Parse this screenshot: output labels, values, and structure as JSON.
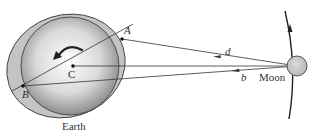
{
  "labels": {
    "earth": "Earth",
    "moon": "Moon",
    "point_a": "A",
    "point_b": "B",
    "point_c": "C",
    "distance_d": "d",
    "distance_b": "b"
  },
  "colors": {
    "earth_light": "#f4f4f4",
    "earth_dark": "#8a8a8a",
    "bulge": "#c8c8c8",
    "moon_fill": "#c9c9c9",
    "line": "#333333"
  }
}
